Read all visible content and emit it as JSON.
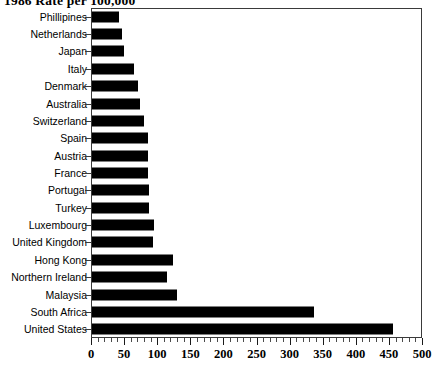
{
  "chart_data": {
    "type": "bar",
    "orientation": "horizontal",
    "title": "1986 Rate per 100,000",
    "xlabel": "",
    "ylabel": "",
    "xlim": [
      0,
      500
    ],
    "xticks": [
      0,
      50,
      100,
      150,
      200,
      250,
      300,
      350,
      400,
      450,
      500
    ],
    "xtick_labels": [
      "0",
      "50",
      "100",
      "150",
      "200",
      "250",
      "300",
      "350",
      "400",
      "450",
      "500"
    ],
    "minor_tick_step": 10,
    "grid": false,
    "legend": null,
    "bar_color": "#000000",
    "frame_color": "#3a3a3a",
    "categories": [
      "Phillipines",
      "Netherlands",
      "Japan",
      "Italy",
      "Denmark",
      "Australia",
      "Switzerland",
      "Spain",
      "Austria",
      "France",
      "Portugal",
      "Turkey",
      "Luxembourg",
      "United Kingdom",
      "Hong Kong",
      "Northern Ireland",
      "Malaysia",
      "South Africa",
      "United States"
    ],
    "values": [
      41,
      45,
      48,
      63,
      69,
      72,
      78,
      84,
      85,
      85,
      86,
      86,
      94,
      92,
      122,
      113,
      128,
      335,
      455
    ]
  }
}
